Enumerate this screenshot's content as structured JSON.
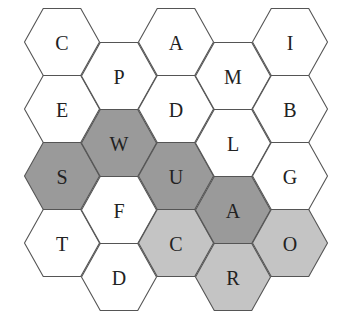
{
  "colors": {
    "white": "#ffffff",
    "dark": "#9a9a9a",
    "light": "#c4c4c4",
    "stroke": "#555555"
  },
  "cells": [
    {
      "id": "c0r0",
      "letter": "C",
      "col": 0,
      "row": 0,
      "shade": "white"
    },
    {
      "id": "c0r1",
      "letter": "E",
      "col": 0,
      "row": 1,
      "shade": "white"
    },
    {
      "id": "c0r2",
      "letter": "S",
      "col": 0,
      "row": 2,
      "shade": "dark"
    },
    {
      "id": "c0r3",
      "letter": "T",
      "col": 0,
      "row": 3,
      "shade": "white"
    },
    {
      "id": "c1r0",
      "letter": "P",
      "col": 1,
      "row": 0,
      "shade": "white"
    },
    {
      "id": "c1r1",
      "letter": "W",
      "col": 1,
      "row": 1,
      "shade": "dark"
    },
    {
      "id": "c1r2",
      "letter": "F",
      "col": 1,
      "row": 2,
      "shade": "white"
    },
    {
      "id": "c1r3",
      "letter": "D",
      "col": 1,
      "row": 3,
      "shade": "white"
    },
    {
      "id": "c2r0",
      "letter": "A",
      "col": 2,
      "row": 0,
      "shade": "white"
    },
    {
      "id": "c2r1",
      "letter": "D",
      "col": 2,
      "row": 1,
      "shade": "white"
    },
    {
      "id": "c2r2",
      "letter": "U",
      "col": 2,
      "row": 2,
      "shade": "dark"
    },
    {
      "id": "c2r3",
      "letter": "C",
      "col": 2,
      "row": 3,
      "shade": "light"
    },
    {
      "id": "c3r0",
      "letter": "M",
      "col": 3,
      "row": 0,
      "shade": "white"
    },
    {
      "id": "c3r1",
      "letter": "L",
      "col": 3,
      "row": 1,
      "shade": "white"
    },
    {
      "id": "c3r2",
      "letter": "A",
      "col": 3,
      "row": 2,
      "shade": "dark"
    },
    {
      "id": "c3r3",
      "letter": "R",
      "col": 3,
      "row": 3,
      "shade": "light"
    },
    {
      "id": "c4r0",
      "letter": "I",
      "col": 4,
      "row": 0,
      "shade": "white"
    },
    {
      "id": "c4r1",
      "letter": "B",
      "col": 4,
      "row": 1,
      "shade": "white"
    },
    {
      "id": "c4r2",
      "letter": "G",
      "col": 4,
      "row": 2,
      "shade": "white"
    },
    {
      "id": "c4r3",
      "letter": "O",
      "col": 4,
      "row": 3,
      "shade": "light"
    }
  ]
}
